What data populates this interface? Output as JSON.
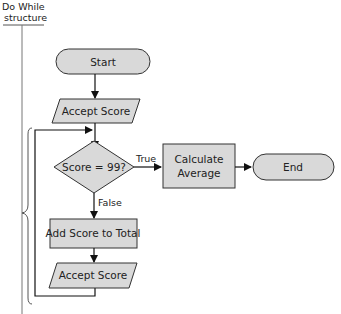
{
  "annotation": {
    "line1": "Do While",
    "line2": "structure"
  },
  "nodes": {
    "start": "Start",
    "accept_score_1": "Accept Score",
    "decision": "Score = 99?",
    "calc_line1": "Calculate",
    "calc_line2": "Average",
    "end": "End",
    "add_score": "Add Score to Total",
    "accept_score_2": "Accept Score"
  },
  "edges": {
    "true_label": "True",
    "false_label": "False"
  },
  "colors": {
    "shape_fill": "#d9d9d9",
    "stroke": "#333333"
  }
}
